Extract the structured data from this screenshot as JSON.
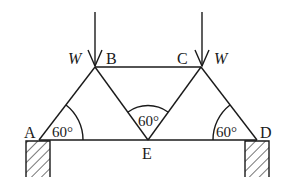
{
  "diagram": {
    "type": "truss",
    "nodes": {
      "A": {
        "label": "A"
      },
      "B": {
        "label": "B"
      },
      "C": {
        "label": "C"
      },
      "D": {
        "label": "D"
      },
      "E": {
        "label": "E"
      }
    },
    "loads": [
      {
        "at": "B",
        "label": "W"
      },
      {
        "at": "C",
        "label": "W"
      }
    ],
    "angles": [
      {
        "at": "A",
        "label": "60°"
      },
      {
        "at": "E",
        "label": "60°"
      },
      {
        "at": "D",
        "label": "60°"
      }
    ],
    "members": [
      "AB",
      "BC",
      "CD",
      "BE",
      "CE",
      "AE",
      "ED"
    ],
    "supports": [
      "A",
      "D"
    ]
  }
}
